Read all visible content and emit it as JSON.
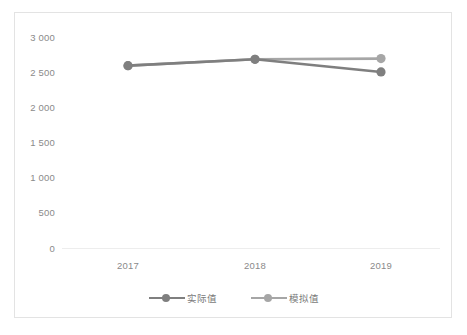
{
  "chart_data": {
    "type": "line",
    "title": "",
    "xlabel": "",
    "ylabel": "",
    "categories": [
      "2017",
      "2018",
      "2019"
    ],
    "series": [
      {
        "name": "实际值",
        "color": "#7f7f7f",
        "values": [
          2600,
          2690,
          2510
        ]
      },
      {
        "name": "模拟值",
        "color": "#a6a6a6",
        "values": [
          2600,
          2690,
          2700
        ]
      }
    ],
    "ylim": [
      0,
      3000
    ],
    "ytick_step": 500,
    "ytick_labels": [
      "3 000",
      "2 500",
      "2 000",
      "1 500",
      "1 000",
      "500",
      "0"
    ],
    "ytick_values": [
      3000,
      2500,
      2000,
      1500,
      1000,
      500,
      0
    ],
    "xtick_labels": [
      "2017",
      "2018",
      "2019"
    ],
    "grid": false,
    "legend_position": "bottom-center",
    "axis_line_color": "#ededed",
    "border_color": "#e3e3e3",
    "tick_label_color": "#8a8a8a",
    "background": "#ffffff"
  },
  "legend": {
    "items": [
      {
        "label": "实际值"
      },
      {
        "label": "模拟值"
      }
    ]
  }
}
